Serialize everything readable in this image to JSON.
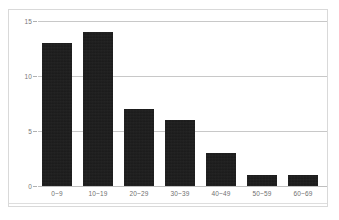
{
  "chart_data": {
    "type": "bar",
    "title": "",
    "subtitle": "",
    "xlabel": "",
    "ylabel": "",
    "categories": [
      "0~9",
      "10~19",
      "20~29",
      "30~39",
      "40~49",
      "50~59",
      "60~69"
    ],
    "values": [
      13,
      14,
      7,
      6,
      3,
      1,
      1
    ],
    "series": [
      {
        "name": "count",
        "values": [
          13,
          14,
          7,
          6,
          3,
          1,
          1
        ]
      }
    ],
    "ylim": [
      0,
      15
    ],
    "yticks": [
      0,
      5,
      10,
      15
    ],
    "ytick_labels": [
      "0",
      "5",
      "10",
      "15"
    ],
    "grid": "horizontal",
    "legend": "none",
    "annotations": [],
    "colors": {
      "bar_fill": "#1c1c1c",
      "gridline": "#c8c8c8",
      "axis_line": "#c0c0c0",
      "frame_border": "#d9d9d9",
      "tick_label": "#6f6f6f",
      "background": "#ffffff"
    }
  }
}
